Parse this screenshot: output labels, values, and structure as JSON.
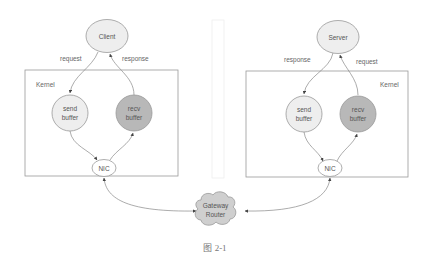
{
  "diagram": {
    "caption": "图 2-1",
    "colors": {
      "light_node": "#eeeeee",
      "dark_node": "#b8b8b8",
      "cloud": "#cfcfcf",
      "stroke": "#888888",
      "box": "#999999",
      "text": "#555555"
    },
    "client_side": {
      "endpoint": "Client",
      "kernel_label": "Kernel",
      "edge_out": "request",
      "edge_in": "response",
      "send_buffer": [
        "send",
        "buffer"
      ],
      "recv_buffer": [
        "recv",
        "buffer"
      ],
      "nic": "NIC"
    },
    "server_side": {
      "endpoint": "Server",
      "kernel_label": "Kernel",
      "edge_out": "response",
      "edge_in": "request",
      "send_buffer": [
        "send",
        "buffer"
      ],
      "recv_buffer": [
        "recv",
        "buffer"
      ],
      "nic": "NIC"
    },
    "gateway": [
      "Gateway",
      "Router"
    ]
  }
}
